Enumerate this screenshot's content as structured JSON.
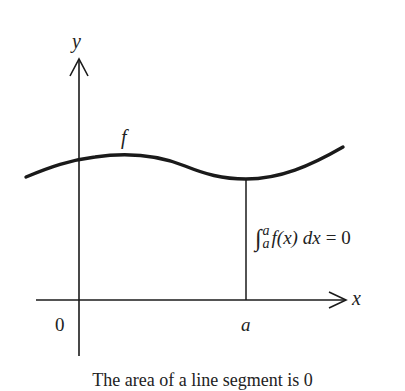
{
  "figure": {
    "axes": {
      "x_label": "x",
      "y_label": "y",
      "origin_label": "0"
    },
    "curve": {
      "label": "f",
      "color": "#1a1a1a"
    },
    "point": {
      "label": "a"
    },
    "annotation": {
      "integral_upper": "a",
      "integral_lower": "a",
      "integrand": "f(x) dx",
      "equals": "=",
      "result": "0"
    },
    "caption": "The area of a line segment is 0"
  }
}
